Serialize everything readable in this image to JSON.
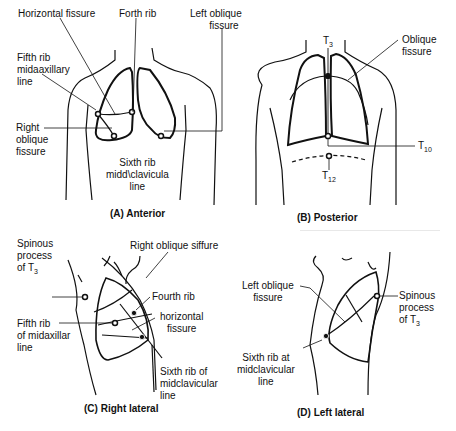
{
  "panels": {
    "anterior": {
      "caption": "(A) Anterior",
      "labels": {
        "horizontal_fissure": "Horizontal fissure",
        "forth_rib": "Forth rib",
        "left_oblique_1": "Left oblique",
        "left_oblique_2": "fissure",
        "fifth_rib_1": "Fifth rib",
        "fifth_rib_2": "midaaxillary",
        "fifth_rib_3": "line",
        "right_oblique_1": "Right",
        "right_oblique_2": "oblique",
        "right_oblique_3": "fissure",
        "sixth_rib_1": "Sixth rib",
        "sixth_rib_2": "midd\\clavicula",
        "sixth_rib_3": "line"
      }
    },
    "posterior": {
      "caption": "(B) Posterior",
      "labels": {
        "t3": "T",
        "t3_sub": "3",
        "oblique_1": "Oblique",
        "oblique_2": "fissure",
        "t10": "T",
        "t10_sub": "10",
        "t12": "T",
        "t12_sub": "12"
      }
    },
    "right_lateral": {
      "caption": "(C) Right lateral",
      "labels": {
        "spinous_1": "Spinous",
        "spinous_2": "process",
        "spinous_3": "of T",
        "spinous_sub": "3",
        "right_oblique": "Right oblique siffure",
        "fourth_rib": "Fourth rib",
        "horizontal_1": "horizontal",
        "horizontal_2": "fissure",
        "fifth_rib_1": "Fifth rib",
        "fifth_rib_2": "of midaxillar",
        "fifth_rib_3": "line",
        "sixth_rib_1": "Sixth rib of",
        "sixth_rib_2": "midclavicular",
        "sixth_rib_3": "line"
      }
    },
    "left_lateral": {
      "caption": "(D) Left lateral",
      "labels": {
        "left_oblique_1": "Left oblique",
        "left_oblique_2": "fissure",
        "spinous_1": "Spinous",
        "spinous_2": "process",
        "spinous_3": "of T",
        "spinous_sub": "3",
        "sixth_rib_1": "Sixth rib at",
        "sixth_rib_2": "midclavicular",
        "sixth_rib_3": "line"
      }
    }
  }
}
